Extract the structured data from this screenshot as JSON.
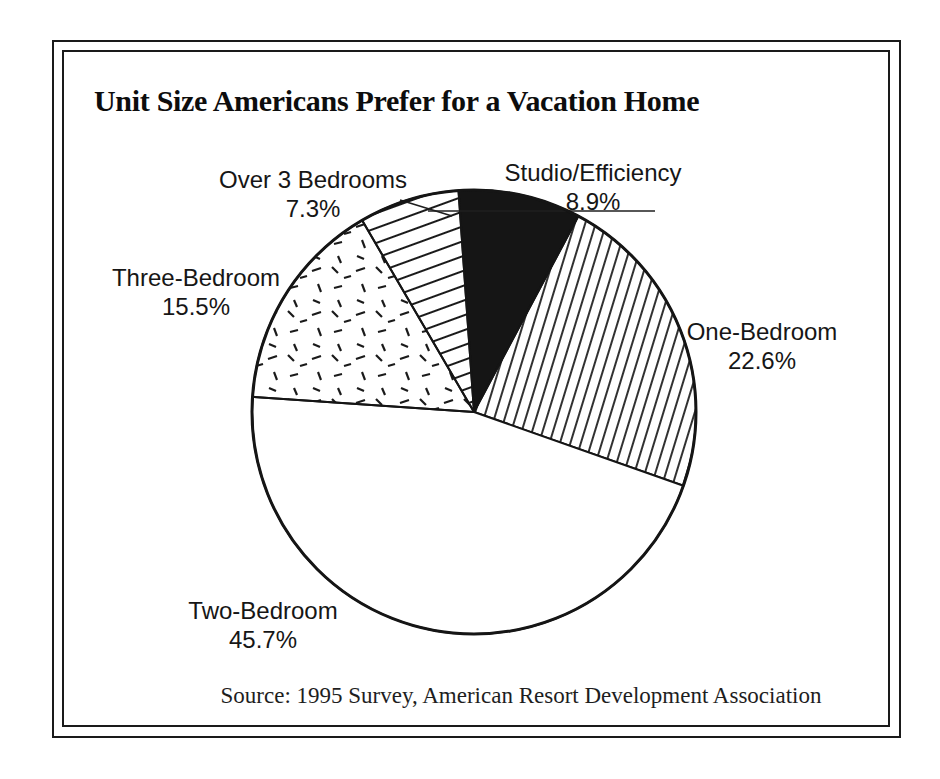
{
  "page": {
    "background_color": "#ffffff",
    "frame_color": "#1a1a1a",
    "text_color": "#161616"
  },
  "title": "Unit Size Americans Prefer for a Vacation Home",
  "source_note": "Source: 1995 Survey, American Resort Development Association",
  "chart_data": {
    "type": "pie",
    "title": "Unit Size Americans Prefer for a Vacation Home",
    "source": "Source: 1995 Survey, American Resort Development Association",
    "slices": [
      {
        "label": "Studio/Efficiency",
        "value_pct": 8.9,
        "display_pct": "8.9%",
        "fill": "solid-black"
      },
      {
        "label": "One-Bedroom",
        "value_pct": 22.6,
        "display_pct": "22.6%",
        "fill": "steep-diagonal-hatch"
      },
      {
        "label": "Two-Bedroom",
        "value_pct": 45.7,
        "display_pct": "45.7%",
        "fill": "plain-white"
      },
      {
        "label": "Three-Bedroom",
        "value_pct": 15.5,
        "display_pct": "15.5%",
        "fill": "confetti-dashes"
      },
      {
        "label": "Over 3 Bedrooms",
        "value_pct": 7.3,
        "display_pct": "7.3%",
        "fill": "shallow-diagonal-hatch"
      }
    ],
    "layout": {
      "start_angle_deg": 94,
      "direction": "clockwise",
      "center": [
        474,
        412
      ],
      "radius": 222,
      "legend": "none",
      "labels": "outside-with-percent"
    }
  }
}
